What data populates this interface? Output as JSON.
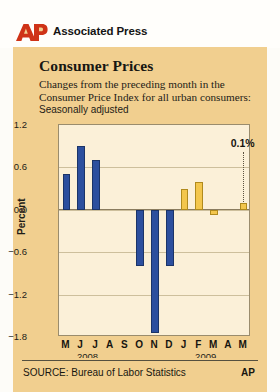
{
  "header": {
    "logo_text": "AP",
    "brand": "Associated Press"
  },
  "chart_data": {
    "type": "bar",
    "title": "Consumer Prices",
    "subtitle": "Changes from the preceding month in the Consumer Price Index for all urban consumers:",
    "note": "Seasonally adjusted",
    "xlabel": "",
    "ylabel": "Percent",
    "ylim": [
      -1.8,
      1.2
    ],
    "yticks": [
      "1.2",
      "0.6",
      "0.0",
      "−0.6",
      "−1.2",
      "−1.8"
    ],
    "ytick_values": [
      1.2,
      0.6,
      0.0,
      -0.6,
      -1.2,
      -1.8
    ],
    "grid": true,
    "legend": "none",
    "categories": [
      "M",
      "J",
      "J",
      "A",
      "S",
      "O",
      "N",
      "D",
      "J",
      "F",
      "M",
      "A",
      "M"
    ],
    "values": [
      0.5,
      0.9,
      0.7,
      0.0,
      0.0,
      -0.8,
      -1.75,
      -0.8,
      0.3,
      0.4,
      -0.08,
      0.0,
      0.1
    ],
    "bar_colors": [
      "blue",
      "blue",
      "blue",
      "blue",
      "blue",
      "blue",
      "blue",
      "blue",
      "gold",
      "gold",
      "gold",
      "gold",
      "gold"
    ],
    "year_groups": [
      {
        "label": "2008",
        "center_index": 1.5
      },
      {
        "label": "2009",
        "center_index": 9.5
      }
    ],
    "annotations": [
      {
        "text": "0.1%",
        "target_index": 12,
        "value": 0.1
      }
    ],
    "colors": {
      "series_2008": "#2c4f9e",
      "series_2009": "#f3c64c",
      "plot_background": "#fbf0d8",
      "card_background": "#f1cf8f",
      "gridline": "#cdbf9c",
      "axis": "#8a7c5f",
      "brand_red": "#cf3317"
    }
  },
  "footer": {
    "source": "SOURCE: Bureau of Labor Statistics",
    "credit": "AP"
  }
}
